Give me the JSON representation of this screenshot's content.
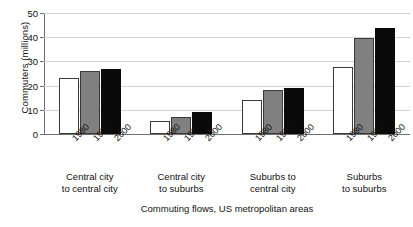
{
  "chart_data": {
    "type": "bar",
    "title": "",
    "xlabel": "Commuting flows, US metropolitan areas",
    "ylabel": "Commuters (millions)",
    "categories": [
      "Central city to central city",
      "Central city to suburbs",
      "Suburbs to central city",
      "Suburbs to suburbs"
    ],
    "category_lines": [
      [
        "Central city",
        "to central city"
      ],
      [
        "Central city",
        "to suburbs"
      ],
      [
        "Suburbs to",
        "central city"
      ],
      [
        "Suburbs",
        "to suburbs"
      ]
    ],
    "series": [
      {
        "name": "1980",
        "color": "#ffffff",
        "values": [
          23,
          5.5,
          14,
          27.5
        ]
      },
      {
        "name": "1990",
        "color": "#808080",
        "values": [
          26,
          7,
          18,
          39.5
        ]
      },
      {
        "name": "2000",
        "color": "#0a0a0a",
        "values": [
          27,
          9,
          19,
          44
        ]
      }
    ],
    "ylim": [
      0,
      50
    ],
    "yticks": [
      0,
      10,
      20,
      30,
      40,
      50
    ],
    "ytick_labels": [
      "0",
      "10",
      "20",
      "30",
      "40",
      "50"
    ],
    "grid": true,
    "legend": "none",
    "bar_order_labels": [
      "1980",
      "1990",
      "2000"
    ]
  },
  "colors": {
    "series_1980": "#ffffff",
    "series_1990": "#808080",
    "series_2000": "#0a0a0a",
    "gridline": "#d2d2d2",
    "axis": "#6f6f6f",
    "text": "#111111",
    "background": "#ffffff"
  }
}
